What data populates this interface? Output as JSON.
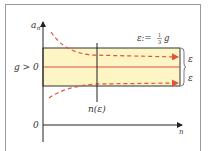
{
  "diagram": {
    "y_axis_label": "a",
    "y_axis_subscript": "n",
    "x_axis_label": "n",
    "limit_label": "g > 0",
    "origin_label": "0",
    "epsilon_definition": "ε:= ⅓ g",
    "epsilon_def_prefix": "ε:=",
    "epsilon_def_num": "1",
    "epsilon_def_den": "3",
    "epsilon_def_suffix": "g",
    "threshold_label": "n(ε)",
    "upper_band_label": "ε",
    "lower_band_label": "ε",
    "colors": {
      "band_fill": "#fdf5c4",
      "band_border": "#333333",
      "limit_line": "#d9534f",
      "sequence_curve": "#e0533a",
      "axis": "#222222",
      "frame": "#9a9a9a"
    }
  }
}
